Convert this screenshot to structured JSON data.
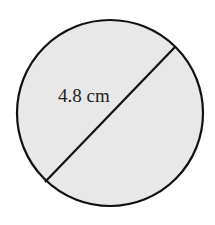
{
  "diagram": {
    "shape": "circle",
    "fill_color": "#e8e8e8",
    "stroke_color": "#111111",
    "circle": {
      "cx": 110,
      "cy": 113,
      "r": 93
    },
    "diameter_line": {
      "x1": 45,
      "y1": 182,
      "x2": 175,
      "y2": 47
    },
    "label": {
      "text": "4.8 cm",
      "x": 58,
      "y": 102
    }
  }
}
